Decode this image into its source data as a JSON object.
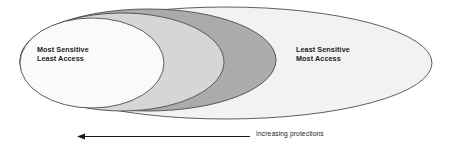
{
  "diagram": {
    "left_label": {
      "line1": "Most Sensitive",
      "line2": "Least Access"
    },
    "right_label": {
      "line1": "Least Sensitive",
      "line2": "Most Access"
    },
    "caption": "Increasing protections",
    "arrow": {
      "direction": "left",
      "name": "increasing-protections-arrow"
    },
    "colors": {
      "outer_fill": "#f2f2f2",
      "band2_fill": "#d6d6d6",
      "band3_fill": "#ababab",
      "inner_fill": "#fafafa",
      "stroke": "#4d4d4d",
      "text": "#1a1a1a",
      "arrow": "#1a1a1a",
      "background": "#ffffff"
    },
    "regions": [
      {
        "name": "outermost-region",
        "label": "Least Sensitive / Most Access",
        "shade": "#f2f2f2"
      },
      {
        "name": "third-region",
        "label": "",
        "shade": "#ababab"
      },
      {
        "name": "second-region",
        "label": "",
        "shade": "#d6d6d6"
      },
      {
        "name": "innermost-region",
        "label": "Most Sensitive / Least Access",
        "shade": "#fafafa"
      }
    ]
  }
}
